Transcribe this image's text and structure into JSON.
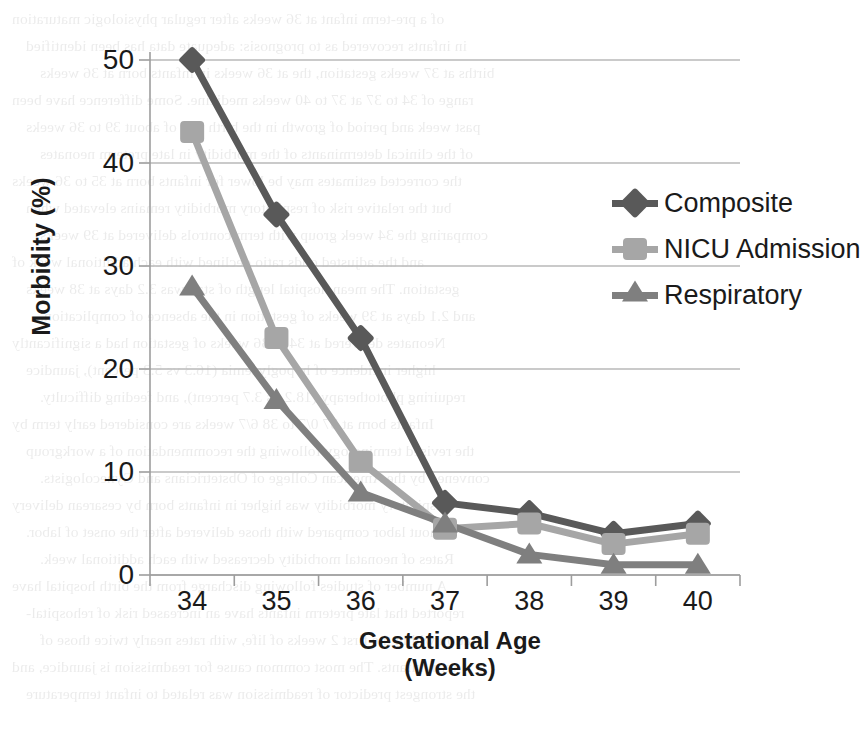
{
  "chart_data": {
    "type": "line",
    "title": "",
    "xlabel": "Gestational Age (Weeks)",
    "xlabel_line1": "Gestational Age",
    "xlabel_line2": "(Weeks)",
    "ylabel": "Morbidity (%)",
    "categories": [
      "34",
      "35",
      "36",
      "37",
      "38",
      "39",
      "40"
    ],
    "ylim": [
      0,
      50
    ],
    "yticks": [
      "0",
      "10",
      "20",
      "30",
      "40",
      "50"
    ],
    "grid": true,
    "legend_position": "right-upper",
    "series": [
      {
        "name": "Composite",
        "marker": "diamond",
        "color": "#595959",
        "values": [
          50,
          35,
          23,
          7,
          6,
          4,
          5
        ]
      },
      {
        "name": "NICU Admission",
        "marker": "square",
        "color": "#a6a6a6",
        "values": [
          43,
          23,
          11,
          4.5,
          5,
          3,
          4
        ]
      },
      {
        "name": "Respiratory",
        "marker": "triangle",
        "color": "#7f7f7f",
        "values": [
          28,
          17,
          8,
          5,
          2,
          1,
          1
        ]
      }
    ]
  },
  "bleed_text": [
    "of a pre-term infant at 36 weeks after regular physiologic maturation",
    "in infants recovered as to prognosis: adequate data has been identified",
    "births at 37 weeks gestation, the at 36 weeks in infants born at 36 weeks",
    "range of 34 to 37 at 37 to 40 weeks medicine. Some difference have been",
    "past week and period of growth in the birth rate of about 39 to 36 weeks",
    "of the clinical determinants of the morbidity in late preterm neonates",
    "the corrected estimates may be lower for infants born at 35 to 36 weeks",
    "but the relative risk of respiratory morbidity remains elevated when",
    "comparing the 34 week group with term controls delivered at 39 weeks",
    "and the adjusted odds ratio declined with each additional week of",
    "gestation. The mean hospital length of stay was 3.2 days at 38 weeks",
    "and 2.1 days at 39 weeks of gestation in the absence of complication.",
    "Neonates delivered at 34 to 36 weeks of gestation had a significantly",
    "higher incidence of hypoglycemia (16.3 vs 5.3 percent), jaundice",
    "requiring phototherapy (18.2 vs 3.7 percent), and feeding difficulty.",
    "Infants born at 37 0/7 to 38 6/7 weeks are considered early term by",
    "the revised terminology following the recommendation of a workgroup",
    "convened by the American College of Obstetricians and Gynecologists.",
    "Respiratory morbidity was higher in infants born by cesarean delivery",
    "without labor compared with those delivered after the onset of labor.",
    "Rates of neonatal morbidity decreased with each additional week.",
    "A number of studies following discharge from the birth hospital have",
    "reported that late preterm infants have an increased risk of rehospital-",
    "ization within the first 2 weeks of life, with rates nearly twice those of",
    "term infants. The most common cause for readmission is jaundice, and",
    "the strongest predictor of readmission was related to infant temperature"
  ]
}
